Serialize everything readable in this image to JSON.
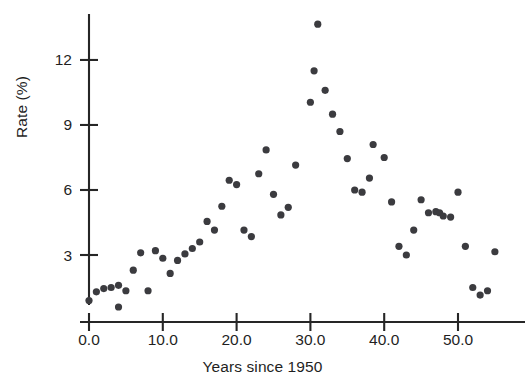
{
  "chart_data": {
    "type": "scatter",
    "title": "",
    "xlabel": "Years since 1950",
    "ylabel": "Rate (%)",
    "xlim": [
      -1.5,
      58.5
    ],
    "ylim": [
      0.0,
      14.4
    ],
    "grid": false,
    "legend": null,
    "marker_color": "#3b3b3f",
    "axis_color": "#262626",
    "background_color": "#ffffff",
    "xticks": [
      0.0,
      10.0,
      20.0,
      30.0,
      40.0,
      50.0
    ],
    "xticklabels": [
      "0.0",
      "10.0",
      "20.0",
      "30.0",
      "40.0",
      "50.0"
    ],
    "yticks": [
      3,
      6,
      9,
      12
    ],
    "yticklabels": [
      "3",
      "6",
      "9",
      "12"
    ],
    "n_points": 57,
    "points": [
      {
        "x": 0,
        "y": 0.9
      },
      {
        "x": 1,
        "y": 1.3
      },
      {
        "x": 2,
        "y": 1.45
      },
      {
        "x": 3,
        "y": 1.5
      },
      {
        "x": 4,
        "y": 0.6
      },
      {
        "x": 4,
        "y": 1.6
      },
      {
        "x": 5,
        "y": 1.35
      },
      {
        "x": 6,
        "y": 2.3
      },
      {
        "x": 7,
        "y": 3.1
      },
      {
        "x": 8,
        "y": 1.35
      },
      {
        "x": 9,
        "y": 3.2
      },
      {
        "x": 10,
        "y": 2.85
      },
      {
        "x": 11,
        "y": 2.15
      },
      {
        "x": 12,
        "y": 2.75
      },
      {
        "x": 13,
        "y": 3.05
      },
      {
        "x": 14,
        "y": 3.3
      },
      {
        "x": 15,
        "y": 3.6
      },
      {
        "x": 16,
        "y": 4.55
      },
      {
        "x": 17,
        "y": 4.15
      },
      {
        "x": 18,
        "y": 5.25
      },
      {
        "x": 19,
        "y": 6.45
      },
      {
        "x": 20,
        "y": 6.25
      },
      {
        "x": 21,
        "y": 4.15
      },
      {
        "x": 22,
        "y": 3.85
      },
      {
        "x": 23,
        "y": 6.75
      },
      {
        "x": 24,
        "y": 7.85
      },
      {
        "x": 25,
        "y": 5.8
      },
      {
        "x": 26,
        "y": 4.85
      },
      {
        "x": 27,
        "y": 5.2
      },
      {
        "x": 28,
        "y": 7.15
      },
      {
        "x": 30,
        "y": 10.05
      },
      {
        "x": 30.5,
        "y": 11.5
      },
      {
        "x": 31,
        "y": 13.65
      },
      {
        "x": 32,
        "y": 10.6
      },
      {
        "x": 33,
        "y": 9.5
      },
      {
        "x": 34,
        "y": 8.7
      },
      {
        "x": 35,
        "y": 7.45
      },
      {
        "x": 36,
        "y": 6.0
      },
      {
        "x": 37,
        "y": 5.9
      },
      {
        "x": 38,
        "y": 6.55
      },
      {
        "x": 38.5,
        "y": 8.1
      },
      {
        "x": 40,
        "y": 7.5
      },
      {
        "x": 41,
        "y": 5.45
      },
      {
        "x": 42,
        "y": 3.4
      },
      {
        "x": 43,
        "y": 3.0
      },
      {
        "x": 44,
        "y": 4.15
      },
      {
        "x": 45,
        "y": 5.55
      },
      {
        "x": 46,
        "y": 4.95
      },
      {
        "x": 47,
        "y": 5.0
      },
      {
        "x": 47.5,
        "y": 4.95
      },
      {
        "x": 48,
        "y": 4.8
      },
      {
        "x": 49,
        "y": 4.75
      },
      {
        "x": 50,
        "y": 5.9
      },
      {
        "x": 51,
        "y": 3.4
      },
      {
        "x": 52,
        "y": 1.5
      },
      {
        "x": 53,
        "y": 1.15
      },
      {
        "x": 54,
        "y": 1.35
      },
      {
        "x": 55,
        "y": 3.15
      }
    ]
  },
  "axes": {
    "y_title": "Rate (%)",
    "x_title": "Years since 1950"
  }
}
